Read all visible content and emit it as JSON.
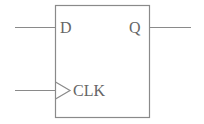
{
  "diagram": {
    "type": "D flip-flop",
    "stroke_color": "#8a8a8a",
    "text_color": "#666666",
    "block": {
      "inputs": [
        {
          "label": "D"
        },
        {
          "label": "CLK",
          "edge_triggered": true
        }
      ],
      "outputs": [
        {
          "label": "Q"
        }
      ]
    }
  }
}
